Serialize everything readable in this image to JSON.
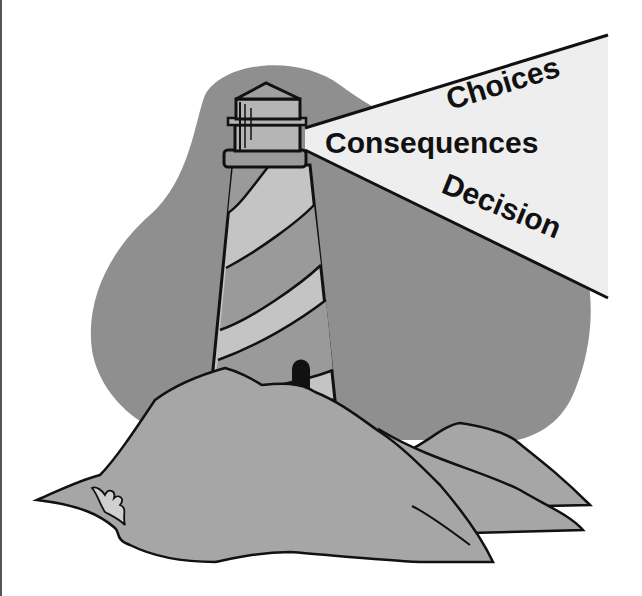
{
  "illustration": {
    "subject": "lighthouse-on-rocks",
    "beam_words": {
      "top": "Choices",
      "middle": "Consequences",
      "bottom": "Decision"
    },
    "colors": {
      "background": "#ffffff",
      "blob": "#8f8f8f",
      "rocks": "#a6a6a6",
      "tower_light": "#c4c4c4",
      "tower_dark": "#9a9a9a",
      "beam": "#eeeeee",
      "outline": "#111111"
    }
  }
}
